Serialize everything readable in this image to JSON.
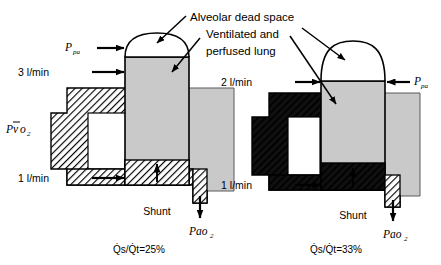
{
  "figure": {
    "title_lines": [
      "Alveolar dead space",
      "Ventilated and",
      "perfused lung"
    ],
    "colors": {
      "lung_fill": "#c9c9c9",
      "deadspace_fill": "#ffffff",
      "outline": "#000000",
      "hatch_light": "#000000",
      "hatch_dark": "#1a1a1a",
      "background": "#ffffff"
    },
    "panels": [
      {
        "id": "left-panel",
        "name": "shunt-25-panel",
        "caption": "Q̇s/Q̇t=25%",
        "caption_parts": {
          "numerator": "Q̇s",
          "slash": "/",
          "denominator": "Q̇t",
          "equals": "=",
          "value": "25%"
        },
        "inflow_top_label": "3 l/min",
        "inflow_bottom_label": "1 l/min",
        "shunt_label": "Shunt",
        "ppa_label": "Ppa",
        "ppa_main": "P",
        "ppa_sub": "pa",
        "pvo2_label": "P̄vo2",
        "pvo2_main": "P",
        "pvo2_bar": "v",
        "pvo2_mid": "o",
        "pvo2_sub": "2",
        "pao2_label": "Pao2",
        "pao2_main": "P",
        "pao2_mid": "ao",
        "pao2_sub": "2"
      },
      {
        "id": "right-panel",
        "name": "shunt-33-panel",
        "caption": "Q̇s/Q̇t=33%",
        "caption_parts": {
          "numerator": "Q̇s",
          "slash": "/",
          "denominator": "Q̇t",
          "equals": "=",
          "value": "33%"
        },
        "inflow_top_label": "2 l/min",
        "inflow_bottom_label": "1 l/min",
        "shunt_label": "Shunt",
        "ppa_label": "Ppa",
        "ppa_main": "P",
        "ppa_sub": "pa",
        "pao2_label": "Pao2",
        "pao2_main": "P",
        "pao2_mid": "ao",
        "pao2_sub": "2"
      }
    ]
  }
}
